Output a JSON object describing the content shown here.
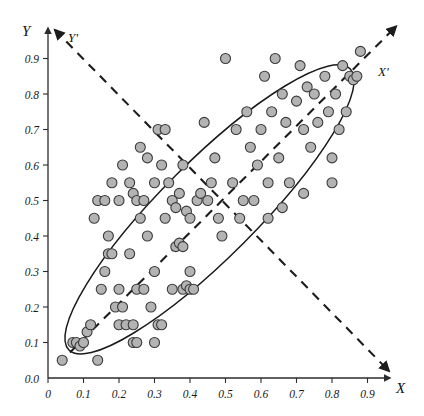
{
  "figure": {
    "title": "",
    "background_color": "#ffffff"
  },
  "axes": {
    "x_label": "X",
    "y_label": "Y",
    "pc1_label": "X'",
    "pc2_label": "Y'",
    "x_ticks": [
      "0",
      "0.1",
      "0.2",
      "0.3",
      "0.4",
      "0.5",
      "0.6",
      "0.7",
      "0.8",
      "0.9"
    ],
    "y_ticks": [
      "0.0",
      "0.1",
      "0.2",
      "0.3",
      "0.4",
      "0.5",
      "0.6",
      "0.7",
      "0.8",
      "0.9"
    ]
  },
  "colors": {
    "marker_fill": "#b3b3b3",
    "marker_stroke": "#3a3a3a",
    "axis": "#2b2b2b",
    "ellipse": "#1a1a1a",
    "pc_axis": "#1c1c1c"
  },
  "chart_data": {
    "type": "scatter",
    "title": "",
    "xlabel": "X",
    "ylabel": "Y",
    "xlim": [
      0.0,
      0.95
    ],
    "ylim": [
      0.0,
      0.95
    ],
    "grid": false,
    "legend": null,
    "marker": {
      "shape": "circle",
      "size_px": 11,
      "fill": "#b3b3b3",
      "edge": "#3a3a3a"
    },
    "annotations": [
      {
        "text": "X'",
        "kind": "principal-axis-label",
        "x": 0.93,
        "y": 0.88
      },
      {
        "text": "Y'",
        "kind": "principal-axis-label",
        "x": 0.12,
        "y": 0.93
      }
    ],
    "overlays": [
      {
        "type": "ellipse",
        "name": "confidence-ellipse",
        "center": [
          0.455,
          0.475
        ],
        "semi_major": 0.56,
        "semi_minor": 0.135,
        "angle_deg": 45,
        "stroke": "#1a1a1a"
      },
      {
        "type": "line",
        "name": "pc1-axis",
        "style": "dashed",
        "from": [
          0.03,
          0.04
        ],
        "to": [
          0.98,
          0.99
        ],
        "arrow": "end"
      },
      {
        "type": "line",
        "name": "pc2-axis",
        "style": "dashed",
        "from": [
          0.02,
          0.98
        ],
        "to": [
          0.96,
          0.02
        ],
        "arrow": "both"
      }
    ],
    "points": [
      [
        0.04,
        0.05
      ],
      [
        0.07,
        0.1
      ],
      [
        0.08,
        0.1
      ],
      [
        0.09,
        0.09
      ],
      [
        0.1,
        0.1
      ],
      [
        0.11,
        0.13
      ],
      [
        0.12,
        0.15
      ],
      [
        0.14,
        0.05
      ],
      [
        0.15,
        0.25
      ],
      [
        0.16,
        0.3
      ],
      [
        0.17,
        0.35
      ],
      [
        0.18,
        0.35
      ],
      [
        0.17,
        0.4
      ],
      [
        0.19,
        0.2
      ],
      [
        0.2,
        0.25
      ],
      [
        0.2,
        0.15
      ],
      [
        0.21,
        0.2
      ],
      [
        0.22,
        0.15
      ],
      [
        0.23,
        0.35
      ],
      [
        0.24,
        0.15
      ],
      [
        0.24,
        0.1
      ],
      [
        0.25,
        0.1
      ],
      [
        0.25,
        0.25
      ],
      [
        0.26,
        0.45
      ],
      [
        0.27,
        0.25
      ],
      [
        0.28,
        0.4
      ],
      [
        0.29,
        0.2
      ],
      [
        0.3,
        0.1
      ],
      [
        0.3,
        0.3
      ],
      [
        0.31,
        0.15
      ],
      [
        0.32,
        0.15
      ],
      [
        0.33,
        0.45
      ],
      [
        0.35,
        0.25
      ],
      [
        0.36,
        0.37
      ],
      [
        0.37,
        0.38
      ],
      [
        0.38,
        0.37
      ],
      [
        0.38,
        0.25
      ],
      [
        0.39,
        0.26
      ],
      [
        0.4,
        0.25
      ],
      [
        0.4,
        0.3
      ],
      [
        0.41,
        0.25
      ],
      [
        0.13,
        0.45
      ],
      [
        0.14,
        0.5
      ],
      [
        0.16,
        0.5
      ],
      [
        0.18,
        0.55
      ],
      [
        0.2,
        0.5
      ],
      [
        0.21,
        0.6
      ],
      [
        0.23,
        0.55
      ],
      [
        0.24,
        0.52
      ],
      [
        0.25,
        0.5
      ],
      [
        0.26,
        0.65
      ],
      [
        0.27,
        0.5
      ],
      [
        0.28,
        0.62
      ],
      [
        0.3,
        0.55
      ],
      [
        0.31,
        0.7
      ],
      [
        0.32,
        0.6
      ],
      [
        0.33,
        0.7
      ],
      [
        0.34,
        0.55
      ],
      [
        0.35,
        0.5
      ],
      [
        0.36,
        0.48
      ],
      [
        0.37,
        0.52
      ],
      [
        0.38,
        0.6
      ],
      [
        0.39,
        0.47
      ],
      [
        0.4,
        0.45
      ],
      [
        0.42,
        0.5
      ],
      [
        0.43,
        0.52
      ],
      [
        0.44,
        0.72
      ],
      [
        0.45,
        0.5
      ],
      [
        0.46,
        0.55
      ],
      [
        0.47,
        0.62
      ],
      [
        0.48,
        0.45
      ],
      [
        0.49,
        0.4
      ],
      [
        0.5,
        0.9
      ],
      [
        0.52,
        0.55
      ],
      [
        0.53,
        0.7
      ],
      [
        0.54,
        0.45
      ],
      [
        0.55,
        0.5
      ],
      [
        0.56,
        0.75
      ],
      [
        0.57,
        0.65
      ],
      [
        0.58,
        0.5
      ],
      [
        0.59,
        0.6
      ],
      [
        0.6,
        0.7
      ],
      [
        0.61,
        0.85
      ],
      [
        0.62,
        0.55
      ],
      [
        0.63,
        0.75
      ],
      [
        0.64,
        0.9
      ],
      [
        0.65,
        0.62
      ],
      [
        0.66,
        0.8
      ],
      [
        0.67,
        0.72
      ],
      [
        0.68,
        0.55
      ],
      [
        0.7,
        0.78
      ],
      [
        0.71,
        0.88
      ],
      [
        0.72,
        0.7
      ],
      [
        0.73,
        0.82
      ],
      [
        0.74,
        0.65
      ],
      [
        0.75,
        0.8
      ],
      [
        0.76,
        0.72
      ],
      [
        0.78,
        0.85
      ],
      [
        0.79,
        0.75
      ],
      [
        0.8,
        0.62
      ],
      [
        0.81,
        0.8
      ],
      [
        0.82,
        0.7
      ],
      [
        0.83,
        0.88
      ],
      [
        0.85,
        0.85
      ],
      [
        0.86,
        0.84
      ],
      [
        0.87,
        0.85
      ],
      [
        0.88,
        0.92
      ],
      [
        0.84,
        0.75
      ],
      [
        0.8,
        0.55
      ],
      [
        0.72,
        0.52
      ],
      [
        0.66,
        0.48
      ],
      [
        0.62,
        0.45
      ]
    ]
  }
}
